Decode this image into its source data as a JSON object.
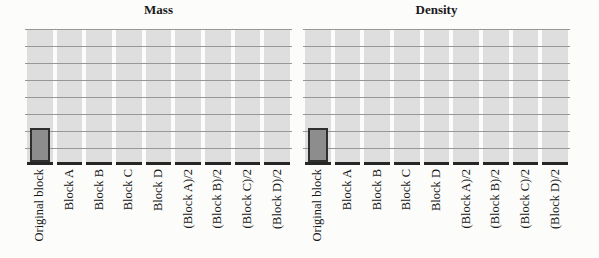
{
  "figure": {
    "kind": "scanned worksheet with two blank bar-chart grids",
    "colors": {
      "background": "#fcfcfb",
      "grid_column_fill": "#dedede",
      "gridline": "#979797",
      "baseline": "#262626",
      "bar_fill": "#8d8d8d",
      "bar_border": "#2f2f2f",
      "text": "#1a1a1a"
    }
  },
  "chart_data": [
    {
      "type": "bar",
      "title": "Mass",
      "categories": [
        "Original block",
        "Block A",
        "Block B",
        "Block C",
        "Block D",
        "(Block A)/2",
        "(Block B)/2",
        "(Block C)/2",
        "(Block D)/2"
      ],
      "values": [
        2,
        0,
        0,
        0,
        0,
        0,
        0,
        0,
        0
      ],
      "xlabel": "",
      "ylabel": "",
      "ylim": [
        0,
        8
      ],
      "grid": true,
      "yticklabels_visible": false,
      "notes": "Blank worksheet grid of 8 rows x 9 columns; only the 'Original block' bar is drawn, 2 grid units tall. X labels rotated 90deg, reading bottom-to-top, text end anchored at axis."
    },
    {
      "type": "bar",
      "title": "Density",
      "categories": [
        "Original block",
        "Block A",
        "Block B",
        "Block C",
        "Block D",
        "(Block A)/2",
        "(Block B)/2",
        "(Block C)/2",
        "(Block D)/2"
      ],
      "values": [
        2,
        0,
        0,
        0,
        0,
        0,
        0,
        0,
        0
      ],
      "xlabel": "",
      "ylabel": "",
      "ylim": [
        0,
        8
      ],
      "grid": true,
      "yticklabels_visible": false,
      "notes": "Identical blank grid; only 'Original block' bar drawn, 2 grid units tall."
    }
  ]
}
